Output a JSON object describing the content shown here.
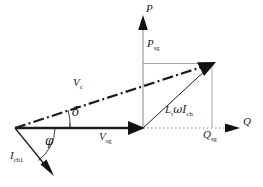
{
  "figure": {
    "type": "phasor-diagram",
    "width": 263,
    "height": 187,
    "background": "#ffffff",
    "stroke_color": "#1c1c1c",
    "thin_stroke_color": "#7a7a7a"
  },
  "axes": {
    "vertical": {
      "name": "P",
      "label": "P",
      "label_pos": {
        "x": 145,
        "y": 4
      },
      "arrow_tip": {
        "x": 143,
        "y": 17
      },
      "base": {
        "x": 143,
        "y": 128
      }
    },
    "horizontal": {
      "name": "Q",
      "label": "Q",
      "label_pos": {
        "x": 243,
        "y": 118
      },
      "arrow_tip": {
        "x": 240,
        "y": 128
      },
      "base": {
        "x": 15,
        "y": 128
      }
    },
    "origin": {
      "x": 15,
      "y": 128
    }
  },
  "vectors": [
    {
      "name": "V_sg",
      "label": "V",
      "sub": "sg",
      "label_pos": {
        "x": 100,
        "y": 134
      },
      "style": "solid-thick",
      "from": {
        "x": 15,
        "y": 128
      },
      "to": {
        "x": 143,
        "y": 128
      }
    },
    {
      "name": "V_c",
      "label": "V",
      "sub": "c",
      "label_pos": {
        "x": 74,
        "y": 80
      },
      "style": "dash-dot-thick",
      "from": {
        "x": 15,
        "y": 128
      },
      "to": {
        "x": 214,
        "y": 63
      }
    },
    {
      "name": "I_ch1",
      "label": "I",
      "sub": "ch1",
      "label_pos": {
        "x": 11,
        "y": 152
      },
      "style": "solid-thin",
      "from": {
        "x": 15,
        "y": 128
      },
      "to": {
        "x": 52,
        "y": 174
      }
    },
    {
      "name": "Lr_omega_I_ch",
      "label": "L",
      "sub": "r",
      "label2": "ωI",
      "sub2": "ch",
      "label_pos": {
        "x": 166,
        "y": 107
      },
      "style": "solid-thin",
      "from": {
        "x": 143,
        "y": 128
      },
      "to": {
        "x": 213,
        "y": 64
      }
    }
  ],
  "projections": [
    {
      "name": "P_sg",
      "label": "P",
      "sub": "sg",
      "label_pos": {
        "x": 147,
        "y": 41
      },
      "from": {
        "x": 143,
        "y": 63
      },
      "to": {
        "x": 212,
        "y": 63
      }
    },
    {
      "name": "Q_sg",
      "label": "Q",
      "sub": "sg",
      "label_pos": {
        "x": 204,
        "y": 131
      },
      "from": {
        "x": 212,
        "y": 63
      },
      "to": {
        "x": 212,
        "y": 128
      }
    }
  ],
  "angles": [
    {
      "name": "delta",
      "label": "δ",
      "label_pos": {
        "x": 72,
        "y": 110
      },
      "vertex": {
        "x": 15,
        "y": 128
      },
      "radius": 55
    },
    {
      "name": "phi",
      "label": "φ",
      "label_pos": {
        "x": 46,
        "y": 139
      },
      "vertex": {
        "x": 15,
        "y": 128
      },
      "radius": 40
    }
  ]
}
